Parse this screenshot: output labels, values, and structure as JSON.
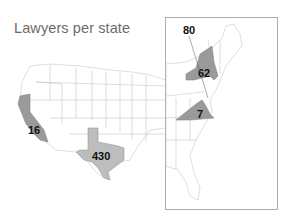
{
  "title": "Lawyers per state",
  "colors": {
    "highlight_dark": "#9a9a9a",
    "highlight_light": "#bdbdbd",
    "state_fill": "#ffffff",
    "state_border": "#c8c8c8",
    "inset_border": "#9a9a9a",
    "label": "#111111",
    "title": "#6b6b6b"
  },
  "states": [
    {
      "name": "California",
      "value": "16"
    },
    {
      "name": "Texas",
      "value": "430"
    },
    {
      "name": "New York",
      "value": "62"
    },
    {
      "name": "Virginia",
      "value": "7"
    },
    {
      "name": "District of Columbia",
      "value": "80"
    }
  ],
  "inset": {
    "region": "East Coast"
  }
}
